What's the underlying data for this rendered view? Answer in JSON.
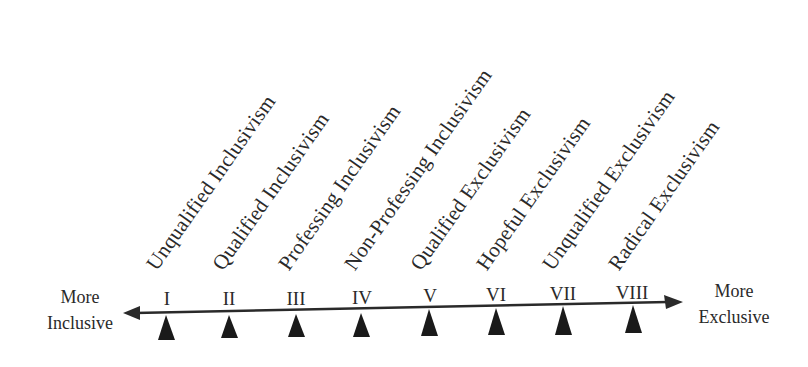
{
  "diagram": {
    "left_end": {
      "line1": "More",
      "line2": "Inclusive"
    },
    "right_end": {
      "line1": "More",
      "line2": "Exclusive"
    },
    "positions": [
      {
        "numeral": "I",
        "label": "Unqualified Inclusivism"
      },
      {
        "numeral": "II",
        "label": "Qualified Inclusivism"
      },
      {
        "numeral": "III",
        "label": "Professing Inclusivism"
      },
      {
        "numeral": "IV",
        "label": "Non-Professing Inclusivism"
      },
      {
        "numeral": "V",
        "label": "Qualified Exclusivism"
      },
      {
        "numeral": "VI",
        "label": "Hopeful Exclusivism"
      },
      {
        "numeral": "VII",
        "label": "Unqualified Exclusivism"
      },
      {
        "numeral": "VIII",
        "label": "Radical Exclusivism"
      }
    ],
    "colors": {
      "ink": "#2a2a2a",
      "background": "#ffffff"
    }
  }
}
